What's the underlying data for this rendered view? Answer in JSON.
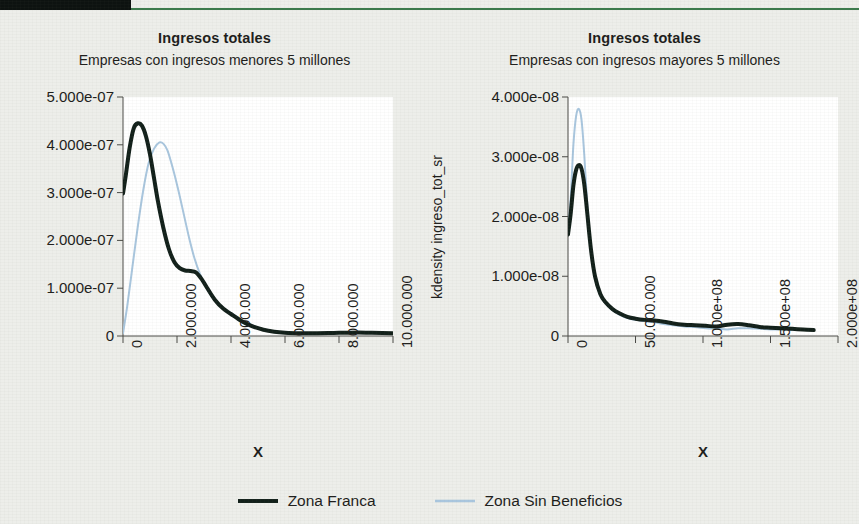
{
  "header": {
    "accent_green": "#3c7a4c",
    "block_color": "#0d1210"
  },
  "legend": {
    "position": "bottom-center",
    "items": [
      {
        "label": "Zona Franca",
        "color": "#12201a",
        "width": 4
      },
      {
        "label": "Zona Sin Beneficios",
        "color": "#a9c6de",
        "width": 2
      }
    ]
  },
  "chart_data": [
    {
      "id": "left",
      "type": "line",
      "title": "Ingresos totales",
      "subtitle": "Empresas con ingresos menores 5 millones",
      "xlabel": "X",
      "ylabel": "kdensity ingreso_tot_sr",
      "xlim": [
        0,
        10000000
      ],
      "ylim": [
        0,
        5e-07
      ],
      "grid": false,
      "xticks": [
        0,
        2000000,
        4000000,
        6000000,
        8000000,
        10000000
      ],
      "xticklabels": [
        "0",
        "2.000.000",
        "4.000.000",
        "6.000.000",
        "8.000.000",
        "10.000.000"
      ],
      "yticks": [
        0,
        1e-07,
        2e-07,
        3e-07,
        4e-07,
        5e-07
      ],
      "yticklabels": [
        "0",
        "1.000e-07",
        "2.000e-07",
        "3.000e-07",
        "4.000e-07",
        "5.000e-07"
      ],
      "series": [
        {
          "name": "Zona Franca",
          "color": "#12201a",
          "width": 4,
          "x": [
            0,
            100000,
            250000,
            400000,
            550000,
            700000,
            850000,
            1000000,
            1150000,
            1300000,
            1500000,
            1700000,
            1900000,
            2100000,
            2300000,
            2500000,
            2700000,
            2900000,
            3100000,
            3400000,
            3700000,
            4000000,
            4400000,
            4800000,
            5200000,
            5600000,
            6000000,
            6600000,
            7200000,
            7800000,
            8400000,
            9000000,
            9600000,
            10000000
          ],
          "y": [
            2.98e-07,
            3.35e-07,
            3.95e-07,
            4.35e-07,
            4.45e-07,
            4.4e-07,
            4.18e-07,
            3.8e-07,
            3.3e-07,
            2.8e-07,
            2.25e-07,
            1.82e-07,
            1.55e-07,
            1.42e-07,
            1.37e-07,
            1.36e-07,
            1.33e-07,
            1.2e-07,
            1.02e-07,
            7.6e-08,
            5.8e-08,
            4.6e-08,
            3.1e-08,
            2e-08,
            1.3e-08,
            9e-09,
            7e-09,
            6e-09,
            6e-09,
            6.5e-09,
            7e-09,
            7e-09,
            6.5e-09,
            6e-09
          ]
        },
        {
          "name": "Zona Sin Beneficios",
          "color": "#a9c6de",
          "width": 2,
          "x": [
            0,
            150000,
            350000,
            550000,
            750000,
            950000,
            1150000,
            1350000,
            1500000,
            1650000,
            1850000,
            2050000,
            2250000,
            2450000,
            2650000,
            2850000,
            3100000,
            3400000,
            3700000,
            4000000,
            4400000,
            4800000,
            5200000,
            5600000,
            6000000,
            6600000,
            7200000,
            7800000,
            8400000,
            9000000,
            9600000,
            10000000
          ],
          "y": [
            6e-09,
            6e-08,
            1.45e-07,
            2.3e-07,
            3.05e-07,
            3.62e-07,
            3.92e-07,
            4.05e-07,
            4.02e-07,
            3.88e-07,
            3.5e-07,
            3.05e-07,
            2.55e-07,
            2.05e-07,
            1.62e-07,
            1.3e-07,
            1e-07,
            7.4e-08,
            5.8e-08,
            4.8e-08,
            3.4e-08,
            2.2e-08,
            1.4e-08,
            9e-09,
            7e-09,
            6e-09,
            6e-09,
            6.5e-09,
            7e-09,
            7e-09,
            6.5e-09,
            6e-09
          ]
        }
      ]
    },
    {
      "id": "right",
      "type": "line",
      "title": "Ingresos totales",
      "subtitle": "Empresas con ingresos mayores 5 millones",
      "xlabel": "X",
      "ylabel": "kdensity ingreso_tot_sr",
      "xlim": [
        0,
        200000000
      ],
      "ylim": [
        0,
        4e-08
      ],
      "grid": false,
      "xticks": [
        0,
        50000000,
        100000000,
        150000000,
        200000000
      ],
      "xticklabels": [
        "0",
        "50.000.000",
        "1.000e+08",
        "1.500e+08",
        "2.000e+08"
      ],
      "yticks": [
        0,
        1e-08,
        2e-08,
        3e-08,
        4e-08
      ],
      "yticklabels": [
        "0",
        "1.000e-08",
        "2.000e-08",
        "3.000e-08",
        "4.000e-08"
      ],
      "series": [
        {
          "name": "Zona Franca",
          "color": "#12201a",
          "width": 4,
          "x": [
            0,
            2000000,
            4000000,
            6000000,
            8000000,
            10000000,
            12000000,
            14000000,
            17000000,
            20000000,
            24000000,
            28000000,
            33000000,
            38000000,
            44000000,
            50000000,
            57000000,
            64000000,
            71000000,
            78000000,
            86000000,
            94000000,
            102000000,
            110000000,
            118000000,
            126000000,
            134000000,
            142000000,
            150000000,
            158000000,
            166000000,
            174000000,
            182000000
          ],
          "y": [
            1.7e-08,
            2.05e-08,
            2.52e-08,
            2.78e-08,
            2.86e-08,
            2.8e-08,
            2.55e-08,
            2.12e-08,
            1.45e-08,
            1e-08,
            7e-09,
            5.6e-09,
            4.5e-09,
            3.8e-09,
            3.2e-09,
            2.9e-09,
            2.7e-09,
            2.6e-09,
            2.4e-09,
            2.1e-09,
            1.9e-09,
            1.8e-09,
            1.7e-09,
            1.6e-09,
            1.9e-09,
            2e-09,
            1.8e-09,
            1.5e-09,
            1.4e-09,
            1.3e-09,
            1.2e-09,
            1.1e-09,
            1e-09
          ]
        },
        {
          "name": "Zona Sin Beneficios",
          "color": "#a9c6de",
          "width": 2,
          "x": [
            0,
            2000000,
            4000000,
            6000000,
            8000000,
            10000000,
            12000000,
            14000000,
            17000000,
            20000000,
            24000000,
            28000000,
            33000000,
            38000000,
            44000000,
            50000000,
            57000000,
            64000000,
            71000000,
            78000000,
            86000000,
            94000000,
            102000000,
            110000000,
            118000000,
            126000000,
            134000000,
            142000000,
            150000000,
            158000000,
            166000000,
            174000000,
            182000000
          ],
          "y": [
            1.72e-08,
            2.3e-08,
            3.2e-08,
            3.68e-08,
            3.8e-08,
            3.62e-08,
            3.05e-08,
            2.3e-08,
            1.42e-08,
            9.6e-09,
            6.8e-09,
            5.4e-09,
            4.3e-09,
            3.6e-09,
            3e-09,
            2.7e-09,
            2.5e-09,
            2.3e-09,
            2e-09,
            1.8e-09,
            1.6e-09,
            1.5e-09,
            1.3e-09,
            1.2e-09,
            1.1e-09,
            1.3e-09,
            1.3e-09,
            1.2e-09,
            1.1e-09,
            1.1e-09,
            1e-09,
            1e-09,
            1e-09
          ]
        }
      ]
    }
  ]
}
